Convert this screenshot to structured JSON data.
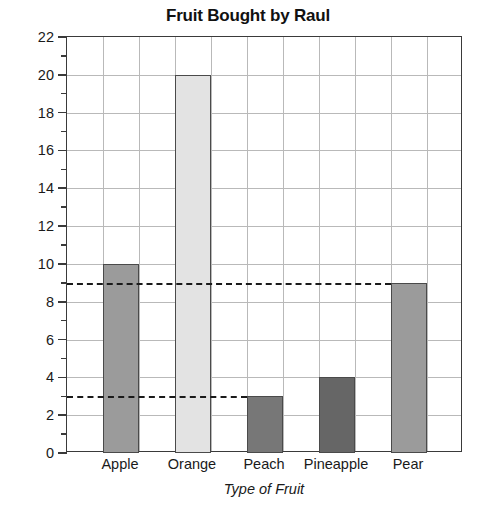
{
  "chart_data": {
    "type": "bar",
    "title": "Fruit Bought by Raul",
    "xlabel": "Type of Fruit",
    "ylabel": "Number of Fruits",
    "categories": [
      "Apple",
      "Orange",
      "Peach",
      "Pineapple",
      "Pear"
    ],
    "values": [
      10,
      20,
      3,
      4,
      9
    ],
    "ylim": [
      0,
      22
    ],
    "y_major_step": 2,
    "y_minor_step": 1,
    "y_tick_labels": [
      "0",
      "2",
      "4",
      "6",
      "8",
      "10",
      "12",
      "14",
      "16",
      "18",
      "20",
      "22"
    ],
    "grid": true,
    "legend": "none",
    "bar_colors": [
      "#9b9b9b",
      "#e3e3e3",
      "#777777",
      "#666666",
      "#9b9b9b"
    ],
    "annotations": [
      {
        "type": "dashed-horizontal-line",
        "y": 9,
        "x_from": 0,
        "x_to": 9
      },
      {
        "type": "dashed-horizontal-line",
        "y": 3,
        "x_from": 0,
        "x_to": 5
      }
    ],
    "columns": 11,
    "bar_columns": [
      1,
      3,
      5,
      7,
      9
    ]
  },
  "colors": {
    "axis": "#3a3a3a",
    "grid": "#b9b9b9",
    "bar_border": "#4a4a4a",
    "dashed": "#1a1a1a",
    "text": "#1a1a1a",
    "background": "#ffffff"
  }
}
